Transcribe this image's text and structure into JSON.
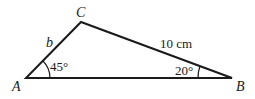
{
  "diagram": {
    "type": "triangle",
    "vertices": {
      "A": {
        "label": "A",
        "x": 26,
        "y": 78
      },
      "B": {
        "label": "B",
        "x": 232,
        "y": 78
      },
      "C": {
        "label": "C",
        "x": 81,
        "y": 22
      }
    },
    "sides": {
      "AC": {
        "label": "b"
      },
      "CB": {
        "label": "10 cm"
      }
    },
    "angles": {
      "A": {
        "label": "45°"
      },
      "B": {
        "label": "20°"
      }
    },
    "colors": {
      "stroke": "#1a1a1a",
      "background": "#ffffff"
    }
  }
}
